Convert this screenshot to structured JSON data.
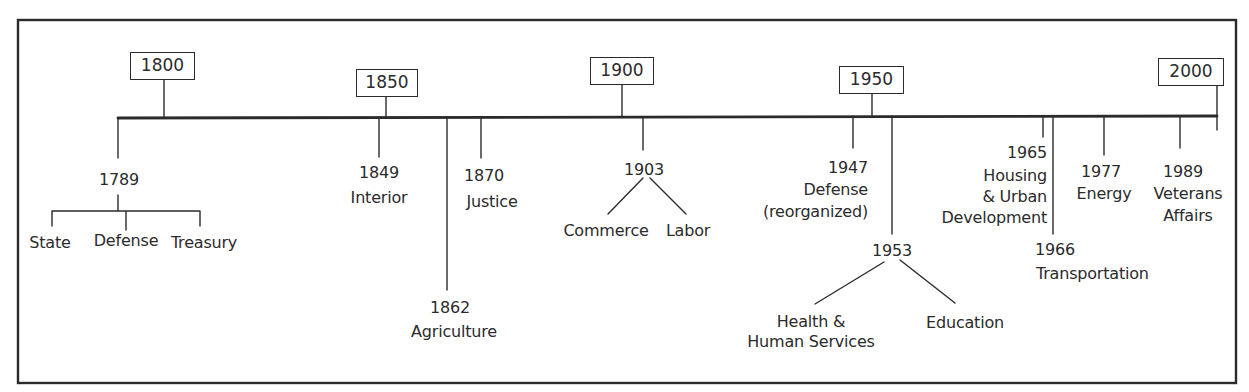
{
  "diagram": {
    "type": "timeline",
    "decades": [
      {
        "label": "1800"
      },
      {
        "label": "1850"
      },
      {
        "label": "1900"
      },
      {
        "label": "1950"
      },
      {
        "label": "2000"
      }
    ],
    "events": [
      {
        "year": "1789",
        "departments": [
          "State",
          "Defense",
          "Treasury"
        ]
      },
      {
        "year": "1849",
        "departments": [
          "Interior"
        ]
      },
      {
        "year": "1862",
        "departments": [
          "Agriculture"
        ]
      },
      {
        "year": "1870",
        "departments": [
          "Justice"
        ]
      },
      {
        "year": "1903",
        "departments": [
          "Commerce",
          "Labor"
        ]
      },
      {
        "year": "1947",
        "departments": [
          "Defense",
          "(reorganized)"
        ]
      },
      {
        "year": "1953",
        "departments": [
          "Health & Human Services",
          "Education"
        ]
      },
      {
        "year": "1965",
        "departments": [
          "Housing",
          "& Urban",
          "Development"
        ]
      },
      {
        "year": "1966",
        "departments": [
          "Transportation"
        ]
      },
      {
        "year": "1977",
        "departments": [
          "Energy"
        ]
      },
      {
        "year": "1989",
        "departments": [
          "Veterans",
          "Affairs"
        ]
      }
    ],
    "colors": {
      "line": "#2b2b2b",
      "background": "#ffffff"
    }
  }
}
